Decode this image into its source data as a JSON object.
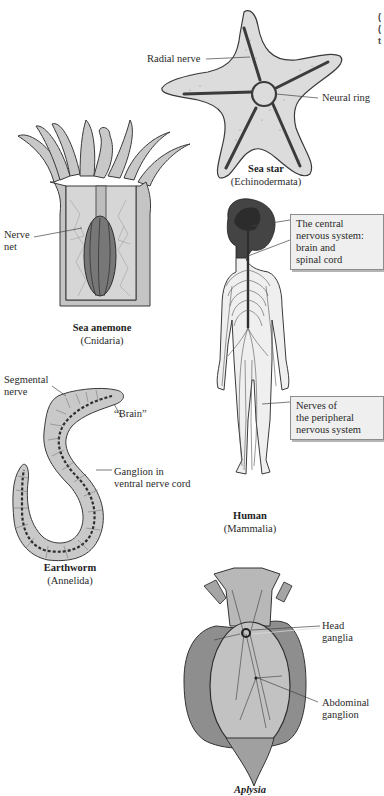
{
  "figure": {
    "organisms": [
      {
        "id": "sea-star",
        "name": "Sea star",
        "taxon": "(Echinodermata)",
        "labels": [
          "Radial nerve",
          "Neural ring"
        ]
      },
      {
        "id": "sea-anemone",
        "name": "Sea anemone",
        "taxon": "(Cnidaria)",
        "labels": [
          "Nerve\nnet"
        ]
      },
      {
        "id": "human",
        "name": "Human",
        "taxon": "(Mammalia)",
        "labels": [
          "The central\nnervous system:\nbrain and\nspinal cord",
          "Nerves of\nthe peripheral\nnervous system"
        ]
      },
      {
        "id": "earthworm",
        "name": "Earthworm",
        "taxon": "(Annelida)",
        "labels": [
          "Segmental\nnerve",
          "“Brain”",
          "Ganglion in\nventral nerve cord"
        ]
      },
      {
        "id": "aplysia",
        "name": "Aplysia",
        "taxon": "",
        "labels": [
          "Head\nganglia",
          "Abdominal\nganglion"
        ]
      }
    ],
    "edge_fragments": [
      "(",
      "(",
      "t"
    ],
    "colors": {
      "outline": "#3a3a3a",
      "nerve": "#3b3b3b",
      "body_fill": "#d9d9d9",
      "body_dark": "#8e8e8e",
      "callout_box": "#efefef"
    }
  }
}
